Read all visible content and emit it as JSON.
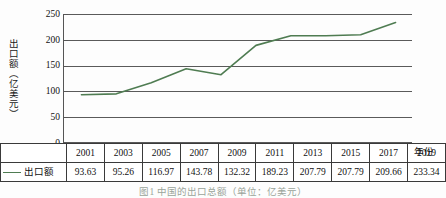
{
  "chart_data": {
    "type": "line",
    "title": "",
    "xlabel": "年份",
    "ylabel": "出口额（亿美元）",
    "categories": [
      "2001",
      "2003",
      "2005",
      "2007",
      "2009",
      "2011",
      "2013",
      "2015",
      "2017",
      "2019"
    ],
    "series": [
      {
        "name": "出口额",
        "values": [
          93.63,
          95.26,
          116.97,
          143.78,
          132.32,
          189.23,
          207.79,
          207.79,
          209.66,
          233.34
        ],
        "color": "#4f7c52"
      }
    ],
    "ylim": [
      0,
      250
    ],
    "yticks": [
      0,
      50,
      100,
      150,
      200,
      250
    ],
    "ytick_labels": [
      "0",
      "50",
      "100",
      "150",
      "200",
      "250"
    ],
    "grid": true,
    "legend_position": "table-row-header"
  },
  "legend": {
    "series_label": "出口额",
    "marker": "line-swatch"
  },
  "table": {
    "year_row_header": "",
    "value_row_header": "出口额",
    "years": [
      "2001",
      "2003",
      "2005",
      "2007",
      "2009",
      "2011",
      "2013",
      "2015",
      "2017",
      "2019"
    ],
    "values": [
      "93.63",
      "95.26",
      "116.97",
      "143.78",
      "132.32",
      "189.23",
      "207.79",
      "207.79",
      "209.66",
      "233.34"
    ]
  },
  "axis": {
    "y_title": "出口额（亿美元）",
    "x_title": "年份",
    "y_labels": [
      "250",
      "200",
      "150",
      "100",
      "50",
      "0"
    ]
  },
  "caption": {
    "text": "图1 中国的出口总额（单位：亿美元）"
  },
  "colors": {
    "line": "#4f7c52",
    "grid": "#5a5a5a",
    "axis": "#555555",
    "table_border": "#3a3a3a",
    "background": "#fdfdfd"
  }
}
